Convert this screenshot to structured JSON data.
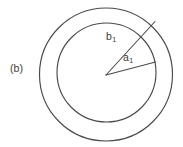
{
  "figure": {
    "panel_tag": "(b)",
    "background_color": "#ffffff",
    "stroke_color": "#4a4a4a",
    "text_color": "#3b3b3b",
    "labels": {
      "outer_radius": {
        "symbol": "b",
        "subscript": "1"
      },
      "inner_radius": {
        "symbol": "a",
        "subscript": "1"
      }
    },
    "geometry": {
      "outer_circle": {
        "cx": 106,
        "cy": 74.5,
        "r": 66.5
      },
      "inner_circle": {
        "cx": 106.5,
        "cy": 72.5,
        "r": 49.5
      },
      "vertex": {
        "x": 106,
        "y": 75
      },
      "outer_ray_end": {
        "x": 155,
        "y": 21.5
      },
      "inner_ray_end": {
        "x": 155.5,
        "y": 62
      }
    }
  }
}
